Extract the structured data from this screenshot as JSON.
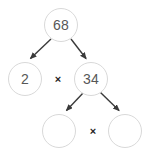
{
  "diagram": {
    "background_color": "#ffffff",
    "node_border_color": "#d9d9d9",
    "node_text_color": "#575757",
    "arrow_color": "#3a3a3a",
    "operator_color": "#1f1f1f",
    "nodes": [
      {
        "id": "root",
        "value": "68",
        "empty": false
      },
      {
        "id": "left",
        "value": "2",
        "empty": false
      },
      {
        "id": "right",
        "value": "34",
        "empty": false
      },
      {
        "id": "blank1",
        "value": "",
        "empty": true
      },
      {
        "id": "blank2",
        "value": "",
        "empty": true
      }
    ],
    "operators": [
      {
        "id": "op_top",
        "symbol": "×"
      },
      {
        "id": "op_bottom",
        "symbol": "×"
      }
    ],
    "edges": [
      {
        "from": "root",
        "to": "left"
      },
      {
        "from": "root",
        "to": "right"
      },
      {
        "from": "right",
        "to": "blank1"
      },
      {
        "from": "right",
        "to": "blank2"
      }
    ]
  }
}
